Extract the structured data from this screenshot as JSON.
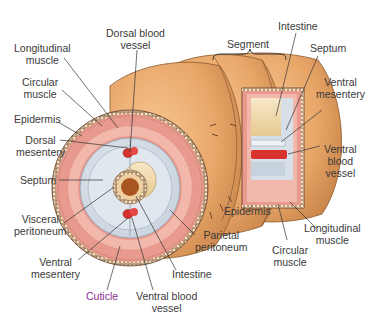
{
  "diagram": {
    "colors": {
      "skin": "#e9a76a",
      "skin_dark": "#c98448",
      "muscle": "#e99a8e",
      "muscle_light": "#f2b8ac",
      "coelom": "#d7dfe8",
      "coelom_light": "#e9eef3",
      "intestine_outer": "#f4ddb0",
      "intestine_lumen": "#a8551f",
      "blood_vessel": "#d8322e",
      "label_text": "#3a3a3a",
      "cuticle_text": "#8a2f8f",
      "leader_line": "#333333"
    },
    "labels": {
      "longitudinal_muscle_left": [
        "Longitudinal",
        "muscle"
      ],
      "circular_muscle_left": [
        "Circular",
        "muscle"
      ],
      "epidermis_left": "Epidermis",
      "dorsal_mesentery": [
        "Dorsal",
        "mesentery"
      ],
      "dorsal_blood_vessel": [
        "Dorsal blood",
        "vessel"
      ],
      "septum_left": "Septum",
      "visceral_peritoneum": [
        "Visceral",
        "peritoneum"
      ],
      "ventral_mesentery_left": [
        "Ventral",
        "mesentery"
      ],
      "cuticle": "Cuticle",
      "ventral_blood_vessel_bottom": [
        "Ventral blood",
        "vessel"
      ],
      "intestine_bottom": "Intestine",
      "parietal_peritoneum": [
        "Parietal",
        "peritoneum"
      ],
      "epidermis_right": "Epidermis",
      "circular_muscle_right": [
        "Circular",
        "muscle"
      ],
      "longitudinal_muscle_right": [
        "Longitudinal",
        "muscle"
      ],
      "segment": "Segment",
      "intestine_top": "Intestine",
      "septum_right": "Septum",
      "ventral_mesentery_right": [
        "Ventral",
        "mesentery"
      ],
      "ventral_blood_vessel_right": [
        "Ventral",
        "blood",
        "vessel"
      ]
    }
  }
}
